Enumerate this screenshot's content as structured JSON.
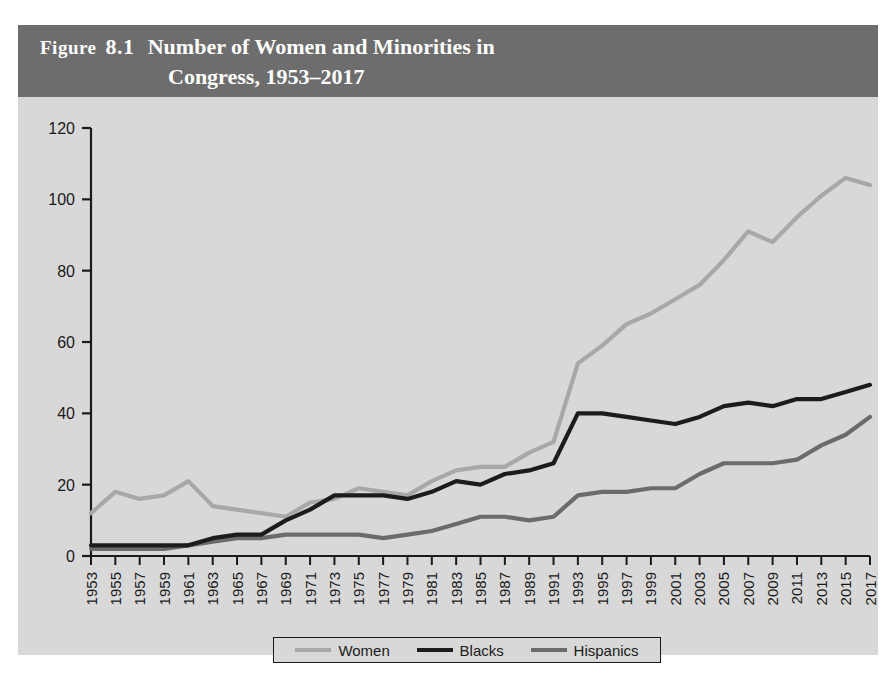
{
  "figure": {
    "label": "Figure",
    "number": "8.1",
    "title_line1": "Number of Women and Minorities in",
    "title_line2": "Congress, 1953–2017",
    "title_full": "Number of Women and Minorities in Congress, 1953–2017",
    "header_bg_color": "#6d6d6d",
    "panel_bg_color": "#d8d8d8"
  },
  "legend": {
    "position": "bottom-center",
    "entries": [
      {
        "label": "Women",
        "color": "#a8a8a8"
      },
      {
        "label": "Blacks",
        "color": "#1c1c1c"
      },
      {
        "label": "Hispanics",
        "color": "#6b6b6b"
      }
    ]
  },
  "chart_data": {
    "type": "line",
    "title": "Number of Women and Minorities in Congress, 1953–2017",
    "xlabel": "",
    "ylabel": "",
    "xlim": [
      1953,
      2017
    ],
    "ylim": [
      0,
      120
    ],
    "yticks": [
      0,
      20,
      40,
      60,
      80,
      100,
      120
    ],
    "ytick_labels": [
      "0",
      "20",
      "40",
      "60",
      "80",
      "100",
      "120"
    ],
    "grid": false,
    "x": [
      1953,
      1955,
      1957,
      1959,
      1961,
      1963,
      1965,
      1967,
      1969,
      1971,
      1973,
      1975,
      1977,
      1979,
      1981,
      1983,
      1985,
      1987,
      1989,
      1991,
      1993,
      1995,
      1997,
      1999,
      2001,
      2003,
      2005,
      2007,
      2009,
      2011,
      2013,
      2015,
      2017
    ],
    "xtick_labels": [
      "1953",
      "1955",
      "1957",
      "1959",
      "1961",
      "1963",
      "1965",
      "1967",
      "1969",
      "1971",
      "1973",
      "1975",
      "1977",
      "1979",
      "1981",
      "1983",
      "1985",
      "1987",
      "1989",
      "1991",
      "1993",
      "1995",
      "1997",
      "1999",
      "2001",
      "2003",
      "2005",
      "2007",
      "2009",
      "2011",
      "2013",
      "2015",
      "2017"
    ],
    "series": [
      {
        "name": "Women",
        "color": "#a8a8a8",
        "values": [
          12,
          18,
          16,
          17,
          21,
          14,
          13,
          12,
          11,
          15,
          16,
          19,
          18,
          17,
          21,
          24,
          25,
          25,
          29,
          32,
          54,
          59,
          65,
          68,
          72,
          76,
          83,
          91,
          88,
          95,
          101,
          106,
          104
        ]
      },
      {
        "name": "Blacks",
        "color": "#1c1c1c",
        "values": [
          3,
          3,
          3,
          3,
          3,
          5,
          6,
          6,
          10,
          13,
          17,
          17,
          17,
          16,
          18,
          21,
          20,
          23,
          24,
          26,
          40,
          40,
          39,
          38,
          37,
          39,
          42,
          43,
          42,
          44,
          44,
          46,
          48
        ]
      },
      {
        "name": "Hispanics",
        "color": "#6b6b6b",
        "values": [
          2,
          2,
          2,
          2,
          3,
          4,
          5,
          5,
          6,
          6,
          6,
          6,
          5,
          6,
          7,
          9,
          11,
          11,
          10,
          11,
          17,
          18,
          18,
          19,
          19,
          23,
          26,
          26,
          26,
          27,
          31,
          34,
          39
        ]
      }
    ]
  }
}
